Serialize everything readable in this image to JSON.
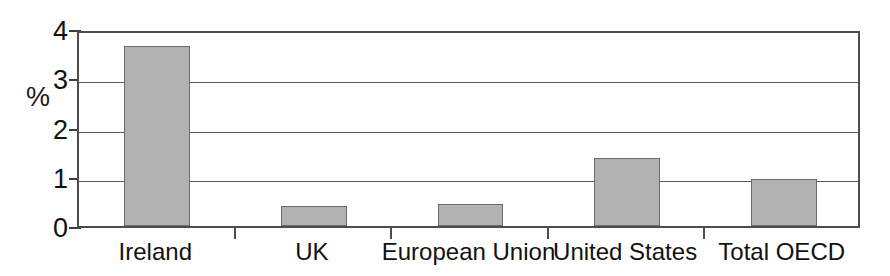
{
  "chart_data": {
    "type": "bar",
    "title": "",
    "xlabel": "",
    "ylabel": "%",
    "categories": [
      "Ireland",
      "UK",
      "European Union",
      "United States",
      "Total OECD"
    ],
    "values": [
      3.65,
      0.4,
      0.45,
      1.38,
      0.95
    ],
    "ylim": [
      0,
      4
    ],
    "yticks": [
      0,
      1,
      2,
      3,
      4
    ],
    "ytick_labels": [
      "0",
      "1",
      "2",
      "3",
      "4"
    ],
    "grid": true,
    "legend": "none",
    "series": [
      {
        "name": "",
        "values": [
          3.65,
          0.4,
          0.45,
          1.38,
          0.95
        ]
      }
    ],
    "colors": {
      "bar_fill": "#b2b2b2",
      "bar_border": "#6b6b6b",
      "axis": "#4d4d4d",
      "gridline": "#5a5a5a",
      "text": "#111111",
      "background": "#ffffff"
    }
  }
}
